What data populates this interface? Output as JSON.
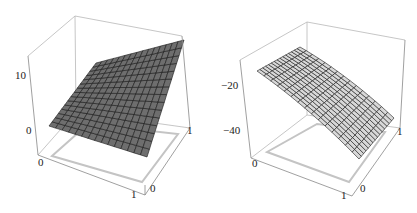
{
  "chart_data": [
    {
      "type": "surface3d",
      "title": "",
      "xlabel": "",
      "ylabel": "",
      "zlabel": "",
      "x_ticks": [
        "0",
        "1"
      ],
      "y_ticks": [
        "0",
        "1"
      ],
      "z_ticks": [
        "0",
        "10"
      ],
      "xlim": [
        0,
        1
      ],
      "ylim": [
        0,
        1
      ],
      "zlim": [
        -3,
        14
      ],
      "surface_color": "#6e6e6e",
      "mesh_lines": 15,
      "description": "Dark gray surface rising from about 0 at the front-left corner to about 13 at the back-right corner, increasing convexly",
      "corners": {
        "x0y0": 0,
        "x1y0": 3,
        "x0y1": 6,
        "x1y1": 13
      }
    },
    {
      "type": "surface3d",
      "title": "",
      "xlabel": "",
      "ylabel": "",
      "zlabel": "",
      "x_ticks": [
        "0",
        "1"
      ],
      "y_ticks": [
        "0",
        "1"
      ],
      "z_ticks": [
        "-20",
        "-40"
      ],
      "xlim": [
        0,
        1
      ],
      "ylim": [
        0,
        1
      ],
      "zlim": [
        -50,
        -5
      ],
      "surface_color": "#d8d8d8",
      "mesh_lines": 15,
      "description": "Light gray concave-down surface, highest (about -15) near the back-left and falling to about -45 at the front-right corner",
      "corners": {
        "x0y0": -17,
        "x1y0": -45,
        "x0y1": -12,
        "x1y1": -30
      }
    }
  ],
  "plots": [
    {
      "z_ticks": [
        {
          "label": "10"
        },
        {
          "label": "0"
        }
      ],
      "x_tick_0": "0",
      "x_tick_1": "1",
      "y_tick_0": "0",
      "y_tick_1": "1"
    },
    {
      "z_ticks": [
        {
          "label": "−20"
        },
        {
          "label": "−40"
        }
      ],
      "x_tick_0": "0",
      "x_tick_1": "1",
      "y_tick_0": "0",
      "y_tick_1": "1"
    }
  ]
}
